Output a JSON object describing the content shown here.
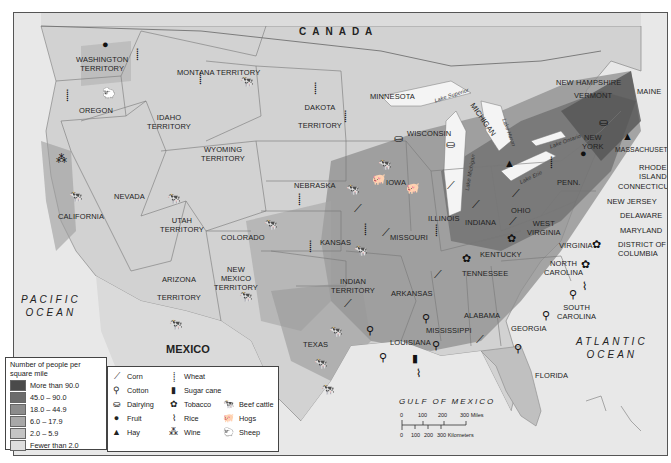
{
  "map": {
    "countries": {
      "north": "CANADA",
      "south": "MEXICO"
    },
    "water": {
      "pacific": [
        "PACIFIC",
        "OCEAN"
      ],
      "atlantic": [
        "ATLANTIC",
        "OCEAN"
      ],
      "gulf": "GULF OF MEXICO",
      "lakes": [
        "Lake Superior",
        "Lake Michigan",
        "Lake Huron",
        "Lake Erie",
        "Lake Ontario"
      ]
    },
    "regions": [
      {
        "name": "WASHINGTON TERRITORY",
        "lines": [
          "WASHINGTON",
          "TERRITORY"
        ]
      },
      {
        "name": "OREGON"
      },
      {
        "name": "MONTANA TERRITORY"
      },
      {
        "name": "IDAHO TERRITORY",
        "lines": [
          "IDAHO",
          "TERRITORY"
        ]
      },
      {
        "name": "WYOMING TERRITORY",
        "lines": [
          "WYOMING",
          "TERRITORY"
        ]
      },
      {
        "name": "DAKOTA TERRITORY",
        "lines": [
          "DAKOTA",
          "TERRITORY"
        ]
      },
      {
        "name": "MINNESOTA"
      },
      {
        "name": "WISCONSIN"
      },
      {
        "name": "MICHIGAN"
      },
      {
        "name": "CALIFORNIA"
      },
      {
        "name": "NEVADA"
      },
      {
        "name": "UTAH TERRITORY",
        "lines": [
          "UTAH",
          "TERRITORY"
        ]
      },
      {
        "name": "COLORADO"
      },
      {
        "name": "NEBRASKA"
      },
      {
        "name": "IOWA"
      },
      {
        "name": "KANSAS"
      },
      {
        "name": "ILLINOIS"
      },
      {
        "name": "INDIANA"
      },
      {
        "name": "OHIO"
      },
      {
        "name": "MISSOURI"
      },
      {
        "name": "ARIZONA TERRITORY",
        "lines": [
          "ARIZONA",
          "TERRITORY"
        ]
      },
      {
        "name": "NEW MEXICO TERRITORY",
        "lines": [
          "NEW",
          "MEXICO",
          "TERRITORY"
        ]
      },
      {
        "name": "INDIAN TERRITORY",
        "lines": [
          "INDIAN",
          "TERRITORY"
        ]
      },
      {
        "name": "ARKANSAS"
      },
      {
        "name": "TEXAS"
      },
      {
        "name": "LOUISIANA"
      },
      {
        "name": "MISSISSIPPI"
      },
      {
        "name": "ALABAMA"
      },
      {
        "name": "GEORGIA"
      },
      {
        "name": "FLORIDA"
      },
      {
        "name": "TENNESSEE"
      },
      {
        "name": "KENTUCKY"
      },
      {
        "name": "WEST VIRGINIA",
        "lines": [
          "WEST",
          "VIRGINIA"
        ]
      },
      {
        "name": "VIRGINIA"
      },
      {
        "name": "NORTH CAROLINA",
        "lines": [
          "NORTH",
          "CAROLINA"
        ]
      },
      {
        "name": "SOUTH CAROLINA",
        "lines": [
          "SOUTH",
          "CAROLINA"
        ]
      },
      {
        "name": "PENN."
      },
      {
        "name": "NEW YORK",
        "lines": [
          "NEW",
          "YORK"
        ]
      },
      {
        "name": "NEW HAMPSHIRE"
      },
      {
        "name": "VERMONT"
      },
      {
        "name": "MAINE"
      },
      {
        "name": "MASSACHUSETTS"
      },
      {
        "name": "RHODE ISLAND",
        "lines": [
          "RHODE",
          "ISLAND"
        ]
      },
      {
        "name": "CONNECTICUT"
      },
      {
        "name": "NEW JERSEY"
      },
      {
        "name": "DELAWARE"
      },
      {
        "name": "MARYLAND"
      },
      {
        "name": "DISTRICT OF COLUMBIA",
        "lines": [
          "DISTRICT OF",
          "COLUMBIA"
        ]
      }
    ]
  },
  "population_legend": {
    "title": "Number of people per square mile",
    "title_lines": [
      "Number of people per",
      "square mile"
    ],
    "entries": [
      {
        "label": "More than 90.0",
        "color": "#4a4a4a"
      },
      {
        "label": "45.0 – 90.0",
        "color": "#6b6b6b"
      },
      {
        "label": "18.0 – 44.9",
        "color": "#8c8c8c"
      },
      {
        "label": "6.0 – 17.9",
        "color": "#a8a8a8"
      },
      {
        "label": "2.0 – 5.9",
        "color": "#c4c4c4"
      },
      {
        "label": "Fewer than 2.0",
        "color": "#dedede"
      }
    ]
  },
  "products_legend": {
    "items": [
      {
        "label": "Corn",
        "icon": "corn-icon",
        "glyph": "⟋"
      },
      {
        "label": "Cotton",
        "icon": "cotton-icon",
        "glyph": "⚲"
      },
      {
        "label": "Dairying",
        "icon": "dairying-icon",
        "glyph": "⛀"
      },
      {
        "label": "Fruit",
        "icon": "fruit-icon",
        "glyph": "●"
      },
      {
        "label": "Hay",
        "icon": "hay-icon",
        "glyph": "▲"
      },
      {
        "label": "Wheat",
        "icon": "wheat-icon",
        "glyph": "⸽"
      },
      {
        "label": "Sugar cane",
        "icon": "sugar-cane-icon",
        "glyph": "▮"
      },
      {
        "label": "Tobacco",
        "icon": "tobacco-icon",
        "glyph": "✿"
      },
      {
        "label": "Rice",
        "icon": "rice-icon",
        "glyph": "⌇"
      },
      {
        "label": "Wine",
        "icon": "wine-icon",
        "glyph": "⁂"
      },
      {
        "label": "Beef cattle",
        "icon": "beef-cattle-icon",
        "glyph": "🐄"
      },
      {
        "label": "Hogs",
        "icon": "hogs-icon",
        "glyph": "🐖"
      },
      {
        "label": "Sheep",
        "icon": "sheep-icon",
        "glyph": "🐑"
      }
    ]
  },
  "scale_bar": {
    "miles_ticks": [
      "0",
      "100",
      "200",
      "300 Miles"
    ],
    "km_ticks": [
      "0",
      "100",
      "200",
      "300 Kilometers"
    ]
  }
}
